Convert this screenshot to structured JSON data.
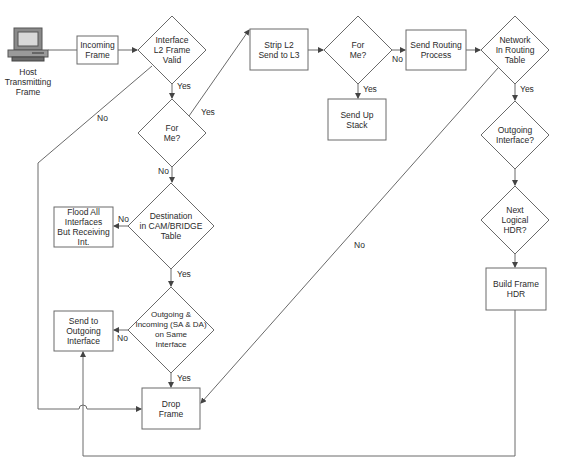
{
  "diagram": {
    "type": "flowchart",
    "colors": {
      "stroke": "#6a6a6a",
      "background": "#ffffff",
      "text": "#2a2a2a"
    },
    "nodes": {
      "host": {
        "label": "Host\nTransmitting\nFrame",
        "shape": "computer-icon"
      },
      "incoming_frame": {
        "label": "Incoming\nFrame",
        "shape": "box"
      },
      "l2_valid": {
        "label": "Interface\nL2 Frame\nValid",
        "shape": "diamond"
      },
      "for_me_l2": {
        "label": "For\nMe?",
        "shape": "diamond"
      },
      "strip_l2": {
        "label": "Strip L2\nSend to L3",
        "shape": "box"
      },
      "for_me_l3": {
        "label": "For\nMe?",
        "shape": "diamond"
      },
      "send_up_stack": {
        "label": "Send Up\nStack",
        "shape": "box"
      },
      "send_routing": {
        "label": "Send Routing\nProcess",
        "shape": "box"
      },
      "network_in_table": {
        "label": "Network\nIn Routing\nTable",
        "shape": "diamond"
      },
      "outgoing_interface": {
        "label": "Outgoing\nInterface?",
        "shape": "diamond"
      },
      "next_logical_hdr": {
        "label": "Next\nLogical\nHDR?",
        "shape": "diamond"
      },
      "build_frame_hdr": {
        "label": "Build Frame\nHDR",
        "shape": "box"
      },
      "dest_in_cam": {
        "label": "Destination\nin CAM/BRIDGE\nTable",
        "shape": "diamond"
      },
      "flood_all": {
        "label": "Flood All\nInterfaces\nBut Receiving\nInt.",
        "shape": "box"
      },
      "same_interface": {
        "label": "Outgoing &\nIncoming (SA & DA)\non Same\nInterface",
        "shape": "diamond"
      },
      "send_to_outgoing": {
        "label": "Send to\nOutgoing\nInterface",
        "shape": "box"
      },
      "drop_frame": {
        "label": "Drop\nFrame",
        "shape": "box"
      }
    },
    "edges": [
      {
        "from": "host",
        "to": "incoming_frame",
        "label": ""
      },
      {
        "from": "incoming_frame",
        "to": "l2_valid",
        "label": ""
      },
      {
        "from": "l2_valid",
        "to": "for_me_l2",
        "label": "Yes"
      },
      {
        "from": "l2_valid",
        "to": "drop_frame",
        "label": "No"
      },
      {
        "from": "for_me_l2",
        "to": "strip_l2",
        "label": "Yes"
      },
      {
        "from": "for_me_l2",
        "to": "dest_in_cam",
        "label": "No"
      },
      {
        "from": "strip_l2",
        "to": "for_me_l3",
        "label": ""
      },
      {
        "from": "for_me_l3",
        "to": "send_up_stack",
        "label": "Yes"
      },
      {
        "from": "for_me_l3",
        "to": "send_routing",
        "label": "No"
      },
      {
        "from": "send_routing",
        "to": "network_in_table",
        "label": ""
      },
      {
        "from": "network_in_table",
        "to": "outgoing_interface",
        "label": "Yes"
      },
      {
        "from": "network_in_table",
        "to": "drop_frame",
        "label": "No"
      },
      {
        "from": "outgoing_interface",
        "to": "next_logical_hdr",
        "label": ""
      },
      {
        "from": "next_logical_hdr",
        "to": "build_frame_hdr",
        "label": ""
      },
      {
        "from": "build_frame_hdr",
        "to": "send_to_outgoing",
        "label": ""
      },
      {
        "from": "dest_in_cam",
        "to": "flood_all",
        "label": "No"
      },
      {
        "from": "dest_in_cam",
        "to": "same_interface",
        "label": "Yes"
      },
      {
        "from": "same_interface",
        "to": "send_to_outgoing",
        "label": "No"
      },
      {
        "from": "same_interface",
        "to": "drop_frame",
        "label": "Yes"
      }
    ],
    "edge_labels": {
      "l2_valid_yes": "Yes",
      "l2_valid_no": "No",
      "for_me_l2_yes": "Yes",
      "for_me_l2_no": "No",
      "for_me_l3_yes": "Yes",
      "for_me_l3_no": "No",
      "network_yes": "Yes",
      "network_no": "No",
      "dest_cam_no": "No",
      "dest_cam_yes": "Yes",
      "same_if_no": "No",
      "same_if_yes": "Yes"
    }
  }
}
